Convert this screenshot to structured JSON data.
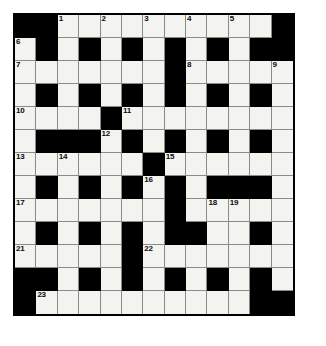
{
  "puzzle": {
    "kind": "crossword-grid",
    "rows": 13,
    "columns": 13,
    "cell_size_px": 21.5,
    "colors": {
      "block": "#000000",
      "open": "#f3f3f0",
      "grid_line": "#8a8a86",
      "border": "#000000",
      "number_text": "#0a0a0a",
      "page_background": "#ffffff"
    },
    "legend": {
      "block_symbol": "#",
      "open_symbol": "."
    },
    "layout_rows": [
      "##...........#",
      "",
      "#"
    ],
    "grid": [
      [
        "#",
        "#",
        ".",
        ".",
        ".",
        ".",
        ".",
        ".",
        ".",
        ".",
        ".",
        ".",
        "#"
      ],
      [
        ".",
        "#",
        ".",
        "#",
        ".",
        "#",
        ".",
        "#",
        ".",
        "#",
        ".",
        "#",
        "#"
      ],
      [
        ".",
        ".",
        ".",
        ".",
        ".",
        ".",
        ".",
        "#",
        ".",
        ".",
        ".",
        ".",
        "."
      ],
      [
        ".",
        "#",
        ".",
        "#",
        ".",
        "#",
        ".",
        "#",
        ".",
        "#",
        ".",
        "#",
        "."
      ],
      [
        ".",
        ".",
        ".",
        ".",
        "#",
        ".",
        ".",
        ".",
        ".",
        ".",
        ".",
        ".",
        "."
      ],
      [
        ".",
        "#",
        "#",
        "#",
        ".",
        "#",
        ".",
        "#",
        ".",
        "#",
        ".",
        "#",
        "."
      ],
      [
        ".",
        ".",
        ".",
        ".",
        ".",
        ".",
        "#",
        ".",
        ".",
        ".",
        ".",
        ".",
        "."
      ],
      [
        ".",
        "#",
        ".",
        "#",
        ".",
        "#",
        ".",
        "#",
        ".",
        "#",
        "#",
        "#",
        "."
      ],
      [
        ".",
        ".",
        ".",
        ".",
        ".",
        ".",
        ".",
        "#",
        ".",
        ".",
        ".",
        ".",
        "."
      ],
      [
        ".",
        "#",
        ".",
        "#",
        ".",
        "#",
        ".",
        "#",
        "#",
        ".",
        ".",
        "#",
        "."
      ],
      [
        ".",
        ".",
        ".",
        ".",
        ".",
        "#",
        ".",
        ".",
        ".",
        ".",
        ".",
        ".",
        "."
      ],
      [
        "#",
        "#",
        ".",
        "#",
        ".",
        "#",
        ".",
        "#",
        ".",
        "#",
        ".",
        "#",
        "."
      ],
      [
        "#",
        ".",
        ".",
        ".",
        ".",
        ".",
        ".",
        ".",
        ".",
        ".",
        ".",
        "#",
        "#"
      ]
    ],
    "numbers": [
      {
        "number": "1",
        "row": 0,
        "col": 2
      },
      {
        "number": "2",
        "row": 0,
        "col": 4
      },
      {
        "number": "3",
        "row": 0,
        "col": 6
      },
      {
        "number": "4",
        "row": 0,
        "col": 8
      },
      {
        "number": "5",
        "row": 0,
        "col": 10
      },
      {
        "number": "6",
        "row": 1,
        "col": 0
      },
      {
        "number": "7",
        "row": 2,
        "col": 0
      },
      {
        "number": "8",
        "row": 2,
        "col": 8
      },
      {
        "number": "9",
        "row": 2,
        "col": 12
      },
      {
        "number": "10",
        "row": 4,
        "col": 0
      },
      {
        "number": "11",
        "row": 4,
        "col": 5
      },
      {
        "number": "12",
        "row": 5,
        "col": 4
      },
      {
        "number": "13",
        "row": 6,
        "col": 0
      },
      {
        "number": "14",
        "row": 6,
        "col": 2
      },
      {
        "number": "15",
        "row": 6,
        "col": 7
      },
      {
        "number": "16",
        "row": 7,
        "col": 6
      },
      {
        "number": "17",
        "row": 8,
        "col": 0
      },
      {
        "number": "18",
        "row": 8,
        "col": 9
      },
      {
        "number": "19",
        "row": 8,
        "col": 10
      },
      {
        "number": "20",
        "row": 9,
        "col": 8
      },
      {
        "number": "21",
        "row": 10,
        "col": 0
      },
      {
        "number": "22",
        "row": 10,
        "col": 6
      },
      {
        "number": "23",
        "row": 12,
        "col": 1
      }
    ]
  }
}
